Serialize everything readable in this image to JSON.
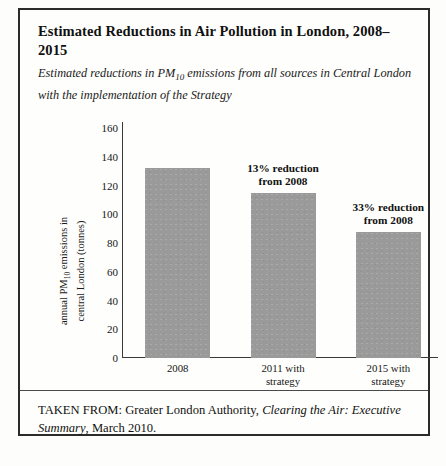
{
  "figure": {
    "title": "Estimated Reductions in Air Pollution in London, 2008–2015",
    "subtitle_pre": "Estimated reductions in PM",
    "subtitle_sub": "10",
    "subtitle_post": " emissions from all sources in Central London with the implementation of the Strategy",
    "source_prefix": "TAKEN FROM: Greater London Authority, ",
    "source_italic": "Clearing the Air: Executive Summary",
    "source_suffix": ", March 2010."
  },
  "axis": {
    "y_title_line1_pre": "annual PM",
    "y_title_line1_sub": "10",
    "y_title_line1_post": " emissions in",
    "y_title_line2": "central London (tonnes)"
  },
  "colors": {
    "bar_fill": "#9a9a9a",
    "axis": "#3a3a3a",
    "frame": "#2b2b2b",
    "text": "#111111",
    "page_background": "#fdfdfb"
  },
  "chart_data": {
    "type": "bar",
    "title": "Estimated Reductions in Air Pollution in London, 2008–2015",
    "subtitle": "Estimated reductions in PM10 emissions from all sources in Central London with the implementation of the Strategy",
    "xlabel": "",
    "ylabel": "annual PM10 emissions in central London (tonnes)",
    "ylim": [
      0,
      160
    ],
    "yticks": [
      0,
      20,
      40,
      60,
      80,
      100,
      120,
      140,
      160
    ],
    "grid": false,
    "legend": "none",
    "categories": [
      "2008",
      "2011 with strategy",
      "2015 with strategy"
    ],
    "category_lines": [
      [
        "2008"
      ],
      [
        "2011 with",
        "strategy"
      ],
      [
        "2015 with",
        "strategy"
      ]
    ],
    "values": [
      132,
      115,
      88
    ],
    "annotations": [
      {
        "category": "2011 with strategy",
        "line1": "13% reduction",
        "line2": "from 2008"
      },
      {
        "category": "2015 with strategy",
        "line1": "33% reduction",
        "line2": "from 2008"
      }
    ]
  }
}
